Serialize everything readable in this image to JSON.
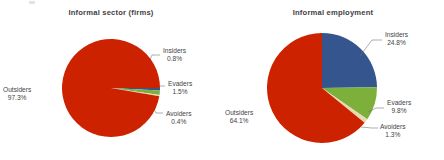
{
  "chart_data": [
    {
      "type": "pie",
      "title": "Informal sector (firms)",
      "categories": [
        "Insiders",
        "Evaders",
        "Avoiders",
        "Outsiders"
      ],
      "values": [
        0.8,
        1.5,
        0.4,
        97.3
      ],
      "value_labels": [
        "0.8%",
        "1.5%",
        "0.4%",
        "97.3%"
      ],
      "colors": [
        "#35558f",
        "#7cb03b",
        "#e9d9af",
        "#cc2200"
      ],
      "start_angle_deg": 0,
      "direction": "clockwise",
      "legend": "none",
      "labels_inline": true,
      "units": "percent"
    },
    {
      "type": "pie",
      "title": "Informal employment",
      "categories": [
        "Insiders",
        "Evaders",
        "Avoiders",
        "Outsiders"
      ],
      "values": [
        24.8,
        9.8,
        1.3,
        64.1
      ],
      "value_labels": [
        "24.8%",
        "9.8%",
        "1.3%",
        "64.1%"
      ],
      "colors": [
        "#35558f",
        "#7cb03b",
        "#e9d9af",
        "#cc2200"
      ],
      "start_angle_deg": 0,
      "direction": "clockwise",
      "legend": "none",
      "labels_inline": true,
      "units": "percent"
    }
  ],
  "panels": [
    {
      "title": "Informal sector (firms)",
      "labels": {
        "insiders": {
          "name": "Insiders",
          "value": "0.8%"
        },
        "evaders": {
          "name": "Evaders",
          "value": "1.5%"
        },
        "avoiders": {
          "name": "Avoiders",
          "value": "0.4%"
        },
        "outsiders": {
          "name": "Outsiders",
          "value": "97.3%"
        }
      }
    },
    {
      "title": "Informal employment",
      "labels": {
        "insiders": {
          "name": "Insiders",
          "value": "24.8%"
        },
        "evaders": {
          "name": "Evaders",
          "value": "9.8%"
        },
        "avoiders": {
          "name": "Avoiders",
          "value": "1.3%"
        },
        "outsiders": {
          "name": "Outsiders",
          "value": "64.1%"
        }
      }
    }
  ],
  "colors": {
    "insiders": "#35558f",
    "evaders": "#7cb03b",
    "avoiders": "#e9d9af",
    "outsiders": "#cc2200",
    "text": "#3f3f3f",
    "background": "#ffffff"
  }
}
